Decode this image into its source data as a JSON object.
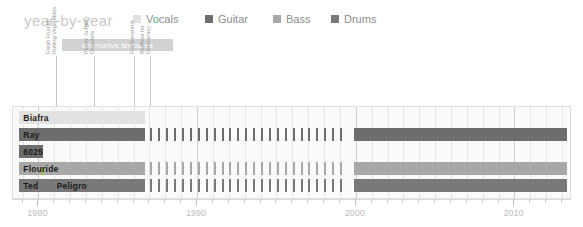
{
  "header": {
    "title": "year-by-year"
  },
  "legend": {
    "items": [
      {
        "label": "Vocals",
        "color": "#e2e2e2",
        "x": 0
      },
      {
        "label": "Guitar",
        "color": "#6d6d6d",
        "x": 72
      },
      {
        "label": "Bass",
        "color": "#a8a8a8",
        "x": 140
      },
      {
        "label": "Drums",
        "color": "#787878",
        "x": 198
      }
    ]
  },
  "album_band": {
    "label": "alternative tentacles",
    "color": "#d2d2d2"
  },
  "annotations": [
    {
      "id": "ann-fresh-fruit",
      "x": 56,
      "lines": [
        "Fresh Fruit for",
        "Rotting Vegetables"
      ]
    },
    {
      "id": "ann-plastic",
      "x": 94,
      "lines": [
        "Plastic Surgery",
        "Disasters"
      ]
    },
    {
      "id": "ann-frankenchrist",
      "x": 134,
      "lines": [
        "Frankenchrist"
      ]
    },
    {
      "id": "ann-bedtime",
      "x": 150,
      "lines": [
        "Bedtime for",
        "Democracy"
      ]
    }
  ],
  "chart_data": {
    "type": "bar",
    "title": "year-by-year",
    "xlabel": "",
    "ylabel": "",
    "xlim": [
      1978.4,
      2013.5
    ],
    "grid": true,
    "legend_position": "top",
    "axis": {
      "tick_labels": [
        "1980",
        "1990",
        "2000",
        "2010"
      ],
      "tick_years": [
        1980,
        1990,
        2000,
        2010
      ],
      "minor_tick_step": 1
    },
    "categories": [
      "Biafra",
      "Ray",
      "6025",
      "Flouride",
      "Ted",
      "Peligro"
    ],
    "series": [
      {
        "name": "Biafra",
        "role": "Vocals",
        "color": "#e2e2e2",
        "label": "Biafra",
        "segments": [
          {
            "start": 1978.8,
            "end": 1986.7,
            "style": "solid"
          }
        ]
      },
      {
        "name": "Ray",
        "role": "Guitar",
        "color": "#6d6d6d",
        "label": "Ray",
        "segments": [
          {
            "start": 1978.8,
            "end": 1986.7,
            "style": "solid"
          },
          {
            "start": 1987.0,
            "end": 1999.4,
            "style": "dashed"
          },
          {
            "start": 1999.9,
            "end": 2013.3,
            "style": "solid"
          }
        ]
      },
      {
        "name": "6025",
        "role": "Guitar",
        "color": "#6d6d6d",
        "label": "6025",
        "segments": [
          {
            "start": 1978.8,
            "end": 1980.3,
            "style": "solid"
          }
        ]
      },
      {
        "name": "Flouride",
        "role": "Bass",
        "color": "#a8a8a8",
        "label": "Flouride",
        "segments": [
          {
            "start": 1978.8,
            "end": 1986.7,
            "style": "solid"
          },
          {
            "start": 1987.0,
            "end": 1999.4,
            "style": "dashed"
          },
          {
            "start": 1999.9,
            "end": 2013.3,
            "style": "solid"
          }
        ]
      },
      {
        "name": "Ted",
        "role": "Drums",
        "color": "#787878",
        "label": "Ted",
        "segments": [
          {
            "start": 1978.8,
            "end": 1980.9,
            "style": "solid"
          }
        ]
      },
      {
        "name": "Peligro",
        "role": "Drums",
        "color": "#787878",
        "label": "Peligro",
        "segments": [
          {
            "start": 1980.9,
            "end": 1986.7,
            "style": "solid"
          },
          {
            "start": 1987.0,
            "end": 1999.4,
            "style": "dashed"
          },
          {
            "start": 1999.9,
            "end": 2013.3,
            "style": "solid"
          }
        ]
      }
    ],
    "rows": [
      {
        "name": "Biafra",
        "top": 4,
        "height": 13
      },
      {
        "name": "Ray",
        "top": 21,
        "height": 13
      },
      {
        "name": "6025",
        "top": 38,
        "height": 13
      },
      {
        "name": "Flouride",
        "top": 55,
        "height": 13
      },
      {
        "name": "drums",
        "top": 72,
        "height": 13
      }
    ]
  }
}
